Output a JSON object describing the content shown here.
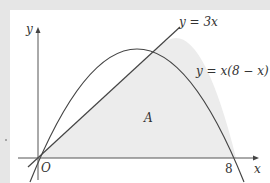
{
  "diagram": {
    "axes": {
      "x_label": "x",
      "y_label": "y",
      "origin_label": "O",
      "x_tick_label": "8"
    },
    "curves": [
      {
        "name": "parabola",
        "equation": "y = x(8 − x)",
        "label": "y = x(8 − x)"
      },
      {
        "name": "line",
        "equation": "y = 3x",
        "label": "y = 3x"
      }
    ],
    "region": {
      "label": "A",
      "description": "region bounded by y = 3x, y = x(8 − x) and the x-axis",
      "fill": "#ececec"
    },
    "colors": {
      "background": "#e6e6e6",
      "canvas": "#ffffff",
      "stroke": "#444444",
      "shade": "#ececec"
    }
  }
}
